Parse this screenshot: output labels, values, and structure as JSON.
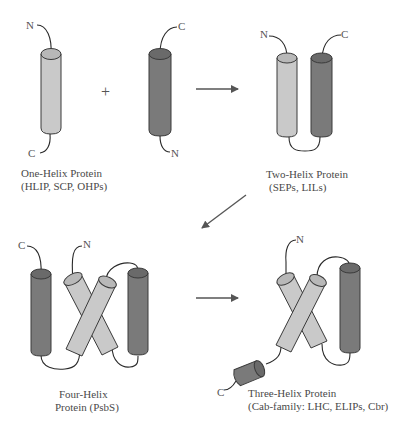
{
  "figure": {
    "type": "schematic diagram of helix protein family evolution",
    "operators": {
      "plus": "+"
    },
    "colors": {
      "light_helix": "#c9c9c9",
      "dark_helix": "#7a7a7a",
      "outline": "#3a3a3a",
      "arrow": "#555555"
    }
  },
  "panels": {
    "one_helix": {
      "title": "One-Helix Protein",
      "subtitle": "(HLIP, SCP, OHPs)",
      "light_helix": {
        "top_terminus": "N",
        "bottom_terminus": "C"
      },
      "dark_helix": {
        "top_terminus": "C",
        "bottom_terminus": "N"
      }
    },
    "two_helix": {
      "title": "Two-Helix Protein",
      "subtitle": "(SEPs, LILs)",
      "termini": {
        "left": "N",
        "right": "C"
      }
    },
    "four_helix": {
      "title": "Four-Helix",
      "subtitle": "Protein (PsbS)",
      "termini": {
        "left": "C",
        "center": "N"
      }
    },
    "three_helix": {
      "title": "Three-Helix Protein",
      "subtitle": "(Cab-family: LHC, ELIPs, Cbr)",
      "termini": {
        "top": "N",
        "bottom": "C"
      }
    }
  }
}
